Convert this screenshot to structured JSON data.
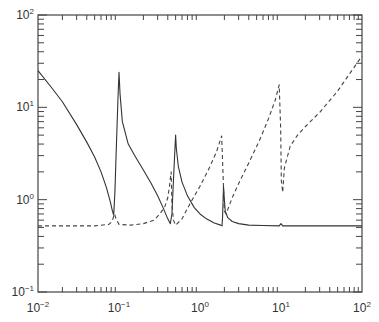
{
  "chart_data": {
    "type": "line",
    "title": "",
    "xlabel": "",
    "ylabel": "",
    "xscale": "log",
    "yscale": "log",
    "xlim": [
      0.01,
      100
    ],
    "ylim": [
      0.1,
      100
    ],
    "grid": false,
    "legend": null,
    "x_ticks": [
      {
        "value": 0.01,
        "base": "10",
        "exp": "-2"
      },
      {
        "value": 0.1,
        "base": "10",
        "exp": "-1"
      },
      {
        "value": 1,
        "base": "10",
        "exp": "0"
      },
      {
        "value": 10,
        "base": "10",
        "exp": "1"
      },
      {
        "value": 100,
        "base": "10",
        "exp": "2"
      }
    ],
    "y_ticks": [
      {
        "value": 0.1,
        "base": "10",
        "exp": "-1"
      },
      {
        "value": 1,
        "base": "10",
        "exp": "0"
      },
      {
        "value": 10,
        "base": "10",
        "exp": "1"
      },
      {
        "value": 100,
        "base": "10",
        "exp": "2"
      }
    ],
    "series": [
      {
        "name": "solid",
        "style": "solid",
        "color": "#333333",
        "points": [
          [
            0.01,
            25
          ],
          [
            0.015,
            16
          ],
          [
            0.02,
            11.5
          ],
          [
            0.03,
            6.5
          ],
          [
            0.04,
            4.2
          ],
          [
            0.05,
            2.9
          ],
          [
            0.06,
            2.0
          ],
          [
            0.07,
            1.35
          ],
          [
            0.078,
            0.95
          ],
          [
            0.083,
            0.75
          ],
          [
            0.086,
            0.68
          ],
          [
            0.089,
            1.2
          ],
          [
            0.093,
            4
          ],
          [
            0.097,
            12
          ],
          [
            0.1,
            24
          ],
          [
            0.103,
            14
          ],
          [
            0.11,
            7
          ],
          [
            0.13,
            4.0
          ],
          [
            0.16,
            2.9
          ],
          [
            0.2,
            2.1
          ],
          [
            0.25,
            1.5
          ],
          [
            0.3,
            1.1
          ],
          [
            0.35,
            0.82
          ],
          [
            0.4,
            0.62
          ],
          [
            0.43,
            0.55
          ],
          [
            0.45,
            0.7
          ],
          [
            0.47,
            1.6
          ],
          [
            0.49,
            3.5
          ],
          [
            0.5,
            5
          ],
          [
            0.51,
            3.6
          ],
          [
            0.54,
            2.3
          ],
          [
            0.6,
            1.55
          ],
          [
            0.7,
            1.1
          ],
          [
            0.85,
            0.82
          ],
          [
            1.0,
            0.7
          ],
          [
            1.2,
            0.62
          ],
          [
            1.5,
            0.56
          ],
          [
            1.8,
            0.53
          ],
          [
            1.87,
            0.52
          ],
          [
            1.9,
            0.65
          ],
          [
            1.95,
            1.4
          ],
          [
            2.0,
            1.0
          ],
          [
            2.05,
            0.75
          ],
          [
            2.2,
            0.64
          ],
          [
            2.5,
            0.58
          ],
          [
            3.0,
            0.55
          ],
          [
            4.0,
            0.53
          ],
          [
            6.0,
            0.525
          ],
          [
            9.5,
            0.52
          ],
          [
            10.0,
            0.55
          ],
          [
            10.5,
            0.52
          ],
          [
            30,
            0.52
          ],
          [
            100,
            0.52
          ]
        ]
      },
      {
        "name": "dashed",
        "style": "dashed",
        "color": "#444444",
        "points": [
          [
            0.01,
            0.52
          ],
          [
            0.05,
            0.52
          ],
          [
            0.075,
            0.54
          ],
          [
            0.082,
            0.58
          ],
          [
            0.088,
            0.7
          ],
          [
            0.092,
            0.62
          ],
          [
            0.1,
            0.54
          ],
          [
            0.14,
            0.53
          ],
          [
            0.2,
            0.55
          ],
          [
            0.27,
            0.6
          ],
          [
            0.32,
            0.7
          ],
          [
            0.37,
            0.85
          ],
          [
            0.4,
            1.05
          ],
          [
            0.42,
            1.4
          ],
          [
            0.44,
            2.0
          ],
          [
            0.45,
            0.9
          ],
          [
            0.47,
            0.6
          ],
          [
            0.5,
            0.53
          ],
          [
            0.6,
            0.62
          ],
          [
            0.75,
            0.9
          ],
          [
            1.0,
            1.4
          ],
          [
            1.3,
            2.2
          ],
          [
            1.6,
            3.3
          ],
          [
            1.85,
            4.9
          ],
          [
            1.92,
            2.0
          ],
          [
            2.0,
            0.75
          ],
          [
            2.1,
            0.7
          ],
          [
            2.5,
            1.05
          ],
          [
            3.0,
            1.5
          ],
          [
            4.0,
            2.5
          ],
          [
            5.5,
            4.5
          ],
          [
            7.0,
            7.5
          ],
          [
            8.5,
            12
          ],
          [
            9.5,
            17.5
          ],
          [
            9.9,
            6
          ],
          [
            10.1,
            1.6
          ],
          [
            10.5,
            1.2
          ],
          [
            11,
            2.2
          ],
          [
            13,
            3.8
          ],
          [
            16,
            5.0
          ],
          [
            20,
            6.2
          ],
          [
            30,
            8.8
          ],
          [
            50,
            15
          ],
          [
            70,
            23
          ],
          [
            100,
            36
          ]
        ]
      }
    ]
  },
  "plot_box": {
    "left": 38,
    "top": 15,
    "right": 362,
    "bottom": 292
  }
}
